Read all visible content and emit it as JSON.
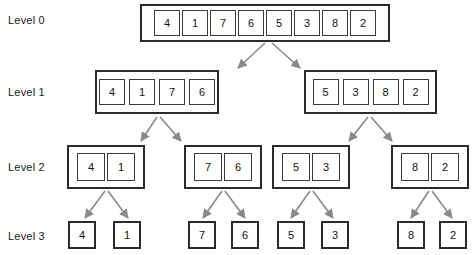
{
  "colors": {
    "box_border": "#2b2b2b",
    "cell_border": "#3a3a3a",
    "arrow": "#8a8a8a",
    "text": "#111111",
    "background": "#ffffff"
  },
  "labels": {
    "level0": "Level 0",
    "level1": "Level 1",
    "level2": "Level 2",
    "level3": "Level 3"
  },
  "levels": [
    {
      "name": "Level 0",
      "groups": [
        {
          "values": [
            "4",
            "1",
            "7",
            "6",
            "5",
            "3",
            "8",
            "2"
          ]
        }
      ]
    },
    {
      "name": "Level 1",
      "groups": [
        {
          "values": [
            "4",
            "1",
            "7",
            "6"
          ]
        },
        {
          "values": [
            "5",
            "3",
            "8",
            "2"
          ]
        }
      ]
    },
    {
      "name": "Level 2",
      "groups": [
        {
          "values": [
            "4",
            "1"
          ]
        },
        {
          "values": [
            "7",
            "6"
          ]
        },
        {
          "values": [
            "5",
            "3"
          ]
        },
        {
          "values": [
            "8",
            "2"
          ]
        }
      ]
    },
    {
      "name": "Level 3",
      "groups": [
        {
          "values": [
            "4"
          ]
        },
        {
          "values": [
            "1"
          ]
        },
        {
          "values": [
            "7"
          ]
        },
        {
          "values": [
            "6"
          ]
        },
        {
          "values": [
            "5"
          ]
        },
        {
          "values": [
            "3"
          ]
        },
        {
          "values": [
            "8"
          ]
        },
        {
          "values": [
            "2"
          ]
        }
      ]
    }
  ]
}
